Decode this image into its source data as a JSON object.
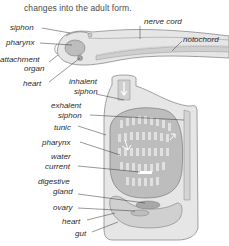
{
  "caption": "changes into the adult form.",
  "larva": {
    "labels": {
      "siphon": "siphon",
      "pharynx": "pharynx",
      "attachment_organ_1": "attachment",
      "attachment_organ_2": "organ",
      "heart": "heart",
      "nerve_cord": "nerve cord",
      "notochord": "notochord"
    }
  },
  "adult": {
    "labels": {
      "inhalent_siphon_1": "inhalent",
      "inhalent_siphon_2": "siphon",
      "exhalent_siphon_1": "exhalent",
      "exhalent_siphon_2": "siphon",
      "tunic": "tunic",
      "pharynx": "pharynx",
      "water_current_1": "water",
      "water_current_2": "current",
      "digestive_gland_1": "digestive",
      "digestive_gland_2": "gland",
      "ovary": "ovary",
      "heart": "heart",
      "gut": "gut"
    }
  },
  "colors": {
    "body_fill": "#d9d9d9",
    "tunic_fill": "#e6e6e6",
    "outline": "#8a8a8a",
    "pharynx_fill": "#bdbdbd",
    "leader_line": "#333333"
  }
}
